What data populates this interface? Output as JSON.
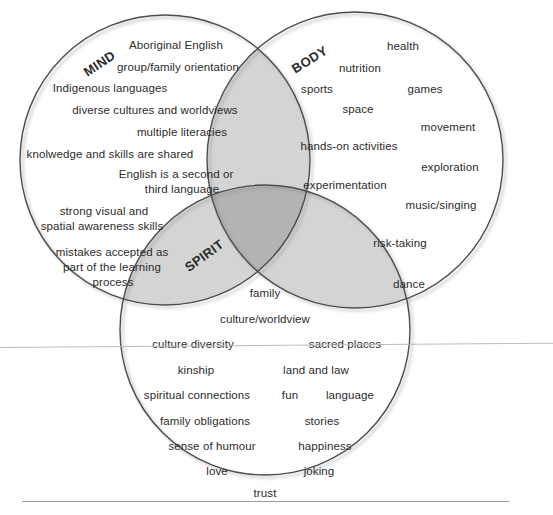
{
  "diagram": {
    "type": "venn-3-circle",
    "colors": {
      "background": "#ffffff",
      "circle_stroke": "#4d4d4d",
      "pair_overlap_fill": "#d4d4d4",
      "triple_overlap_fill": "#b3b3b3",
      "text": "#2b2b2b",
      "rule": "#9a9a9a"
    },
    "circles": [
      {
        "id": "mind",
        "label": "MIND",
        "cx": 165,
        "cy": 160,
        "r": 145,
        "label_x": 82,
        "label_y": 56,
        "label_rotation": -34
      },
      {
        "id": "body",
        "label": "BODY",
        "cx": 355,
        "cy": 160,
        "r": 148,
        "label_x": 290,
        "label_y": 52,
        "label_rotation": -32
      },
      {
        "id": "spirit",
        "label": "SPIRIT",
        "cx": 265,
        "cy": 330,
        "r": 145,
        "label_x": 182,
        "label_y": 248,
        "label_rotation": -36
      }
    ],
    "mind_terms": [
      {
        "text": "Aboriginal English",
        "x": 176,
        "y": 46
      },
      {
        "text": "group/family orientation",
        "x": 178,
        "y": 68
      },
      {
        "text": "Indigenous languages",
        "x": 110,
        "y": 89
      },
      {
        "text": "diverse cultures and worldviews",
        "x": 155,
        "y": 111
      },
      {
        "text": "multiple literacies",
        "x": 182,
        "y": 133
      },
      {
        "text": "knolwedge and skills are shared",
        "x": 110,
        "y": 155
      },
      {
        "text": "English is a second or",
        "x": 176,
        "y": 175
      },
      {
        "text": "third language",
        "x": 182,
        "y": 190
      },
      {
        "text": "strong visual and",
        "x": 104,
        "y": 212
      },
      {
        "text": "spatial awareness skills",
        "x": 102,
        "y": 227
      },
      {
        "text": "mistakes accepted as",
        "x": 112,
        "y": 253
      },
      {
        "text": "part of the learning",
        "x": 112,
        "y": 268
      },
      {
        "text": "process",
        "x": 113,
        "y": 283
      }
    ],
    "body_terms": [
      {
        "text": "health",
        "x": 403,
        "y": 47
      },
      {
        "text": "nutrition",
        "x": 360,
        "y": 69
      },
      {
        "text": "sports",
        "x": 317,
        "y": 90
      },
      {
        "text": "games",
        "x": 425,
        "y": 90
      },
      {
        "text": "space",
        "x": 358,
        "y": 110
      },
      {
        "text": "movement",
        "x": 448,
        "y": 128
      },
      {
        "text": "hands-on activities",
        "x": 349,
        "y": 147
      },
      {
        "text": "exploration",
        "x": 450,
        "y": 168
      },
      {
        "text": "experimentation",
        "x": 345,
        "y": 186
      },
      {
        "text": "music/singing",
        "x": 441,
        "y": 206
      },
      {
        "text": "risk-taking",
        "x": 400,
        "y": 244
      },
      {
        "text": "dance",
        "x": 409,
        "y": 285
      }
    ],
    "spirit_terms": [
      {
        "text": "family",
        "x": 265,
        "y": 294
      },
      {
        "text": "culture/worldview",
        "x": 265,
        "y": 320
      },
      {
        "text": "culture diversity",
        "x": 193,
        "y": 345
      },
      {
        "text": "sacred places",
        "x": 345,
        "y": 345
      },
      {
        "text": "kinship",
        "x": 196,
        "y": 371
      },
      {
        "text": "land and law",
        "x": 316,
        "y": 371
      },
      {
        "text": "spiritual connections",
        "x": 197,
        "y": 396
      },
      {
        "text": "fun",
        "x": 290,
        "y": 396
      },
      {
        "text": "language",
        "x": 350,
        "y": 396
      },
      {
        "text": "family obligations",
        "x": 205,
        "y": 422
      },
      {
        "text": "stories",
        "x": 322,
        "y": 422
      },
      {
        "text": "sense of humour",
        "x": 212,
        "y": 447
      },
      {
        "text": "happiness",
        "x": 325,
        "y": 447
      },
      {
        "text": "love",
        "x": 217,
        "y": 472
      },
      {
        "text": "joking",
        "x": 319,
        "y": 472
      },
      {
        "text": "trust",
        "x": 265,
        "y": 494
      }
    ]
  }
}
